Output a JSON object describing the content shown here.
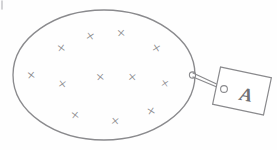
{
  "diagram": {
    "stroke_color": "#8a8a8d",
    "background_color": "#fefefe",
    "ellipse": {
      "name": "area-boundary-ellipse",
      "center_x": 104,
      "center_y": 75,
      "radius_x": 91,
      "radius_y": 65,
      "stroke_width": 1.3
    },
    "field_symbol": "×",
    "field_marks": [
      {
        "label": "×",
        "x": 57,
        "y": 41,
        "size": 15,
        "rotate": -8
      },
      {
        "label": "×",
        "x": 86,
        "y": 29,
        "size": 15,
        "rotate": 10
      },
      {
        "label": "×",
        "x": 117,
        "y": 26,
        "size": 15,
        "rotate": -4
      },
      {
        "label": "×",
        "x": 152,
        "y": 41,
        "size": 15,
        "rotate": 12
      },
      {
        "label": "×",
        "x": 27,
        "y": 68,
        "size": 15,
        "rotate": -6
      },
      {
        "label": "×",
        "x": 58,
        "y": 77,
        "size": 15,
        "rotate": 8
      },
      {
        "label": "×",
        "x": 96,
        "y": 70,
        "size": 15,
        "rotate": -5
      },
      {
        "label": "×",
        "x": 128,
        "y": 70,
        "size": 15,
        "rotate": 4
      },
      {
        "label": "×",
        "x": 161,
        "y": 77,
        "size": 14,
        "rotate": 10
      },
      {
        "label": "×",
        "x": 71,
        "y": 108,
        "size": 15,
        "rotate": -7
      },
      {
        "label": "×",
        "x": 111,
        "y": 114,
        "size": 15,
        "rotate": 6
      },
      {
        "label": "×",
        "x": 147,
        "y": 104,
        "size": 15,
        "rotate": -12
      }
    ],
    "field_mark_count": 12,
    "eyelet_boundary": {
      "name": "boundary-eyelet",
      "cx": 192,
      "cy": 75,
      "r": 3.1
    },
    "eyelet_tag": {
      "name": "tag-eyelet",
      "cx": 224,
      "cy": 89,
      "r": 3.4
    },
    "string": {
      "name": "tag-string",
      "x1": 193,
      "y1": 76,
      "x2": 223,
      "y2": 89
    },
    "string_double": {
      "x1": 193,
      "y1": 73,
      "x2": 223,
      "y2": 87
    },
    "tag": {
      "name": "label-tag",
      "label": "A",
      "label_x": 242,
      "label_y": 95,
      "label_size": 19,
      "rotate": 12,
      "x": 216,
      "y": 72,
      "width": 52,
      "height": 38
    },
    "corner_tick": {
      "name": "corner-tick-mark",
      "x1": 2,
      "y1": 2,
      "x2": 2,
      "y2": 9
    }
  }
}
